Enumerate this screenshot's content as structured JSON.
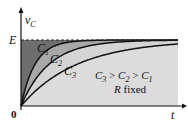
{
  "chart_data": {
    "type": "line",
    "title": "",
    "xlabel": "t",
    "ylabel": "v_C",
    "ylabel_main": "v",
    "ylabel_sub": "C",
    "origin_label": "0",
    "asymptote_label": "E",
    "series": [
      {
        "name": "C1",
        "label_main": "C",
        "label_sub": "1",
        "tau_relative": 1,
        "fill": "#6e6e6e"
      },
      {
        "name": "C2",
        "label_main": "C",
        "label_sub": "2",
        "tau_relative": 2,
        "fill": "#a8a8a8"
      },
      {
        "name": "C3",
        "label_main": "C",
        "label_sub": "3",
        "tau_relative": 4,
        "fill": "#d4d4d4"
      }
    ],
    "annotation_line1": "C3 > C2 > C1",
    "annotation_parts": [
      {
        "main": "C",
        "sub": "3"
      },
      {
        "op": " > "
      },
      {
        "main": "C",
        "sub": "2"
      },
      {
        "op": " > "
      },
      {
        "main": "C",
        "sub": "1"
      }
    ],
    "annotation_line2": "R fixed",
    "annotation_line2_italic": "R",
    "annotation_line2_rest": " fixed",
    "formula": "v_C = E(1 - e^(-t/RC))"
  }
}
